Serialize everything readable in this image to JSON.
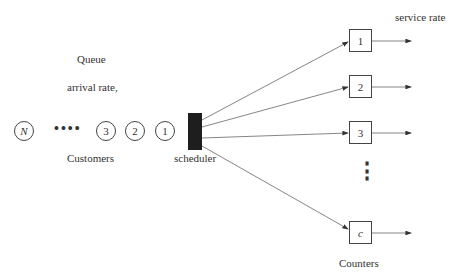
{
  "labels": {
    "queue": "Queue",
    "arrival_rate": "arrival rate,",
    "customers": "Customers",
    "scheduler": "scheduler",
    "service_rate": "service rate",
    "counters": "Counters"
  },
  "customers": [
    {
      "label": "N",
      "italic": true
    },
    {
      "label": "3"
    },
    {
      "label": "2"
    },
    {
      "label": "1"
    }
  ],
  "ellipsis": "••••",
  "counters": [
    {
      "label": "1"
    },
    {
      "label": "2"
    },
    {
      "label": "3"
    },
    {
      "label": "c",
      "italic": true
    }
  ],
  "vertical_ellipsis": "⋮"
}
